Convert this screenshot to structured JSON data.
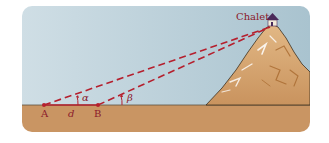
{
  "diagram": {
    "labels": {
      "chalet": "Chalet",
      "point_a": "A",
      "point_b": "B",
      "distance": "d",
      "angle_alpha": "α",
      "angle_beta": "β"
    },
    "colors": {
      "sky": "#c9dbe2",
      "ground": "#c99563",
      "line": "#b5202e",
      "label": "#8b1a2b",
      "mountain": "#d4a36e",
      "chalet_roof": "#4a2a5a"
    }
  }
}
